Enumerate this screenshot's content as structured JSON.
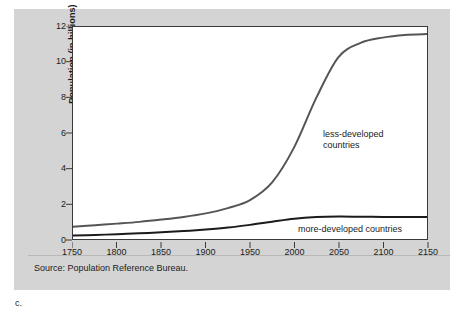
{
  "figure": {
    "caption": "c.",
    "source_note": "Source: Population Reference Bureau.",
    "panel_color": "#d4d4d4",
    "plot_background": "#ffffff"
  },
  "chart_data": {
    "type": "line",
    "title": "",
    "xlabel": "",
    "ylabel": "Population (in billions)",
    "xlim": [
      1750,
      2150
    ],
    "ylim": [
      0,
      12
    ],
    "xticks": [
      1750,
      1800,
      1850,
      1900,
      1950,
      2000,
      2050,
      2100,
      2150
    ],
    "yticks": [
      0,
      2,
      4,
      6,
      8,
      10,
      12
    ],
    "grid": false,
    "legend": "inline-annotations",
    "x": [
      1750,
      1775,
      1800,
      1825,
      1850,
      1875,
      1900,
      1925,
      1950,
      1975,
      2000,
      2025,
      2050,
      2075,
      2100,
      2125,
      2150
    ],
    "series": [
      {
        "name": "less-developed countries",
        "color": "#555555",
        "line_width": 2,
        "annotation": "less-developed\ncountries",
        "values": [
          0.7,
          0.78,
          0.87,
          0.97,
          1.1,
          1.25,
          1.45,
          1.75,
          2.2,
          3.2,
          5.2,
          8.0,
          10.3,
          11.1,
          11.4,
          11.55,
          11.6
        ]
      },
      {
        "name": "more-developed countries",
        "color": "#1b1b1b",
        "line_width": 2,
        "annotation": "more-developed countries",
        "values": [
          0.2,
          0.23,
          0.27,
          0.32,
          0.38,
          0.45,
          0.54,
          0.65,
          0.8,
          0.98,
          1.15,
          1.24,
          1.27,
          1.26,
          1.25,
          1.25,
          1.25
        ]
      }
    ]
  }
}
